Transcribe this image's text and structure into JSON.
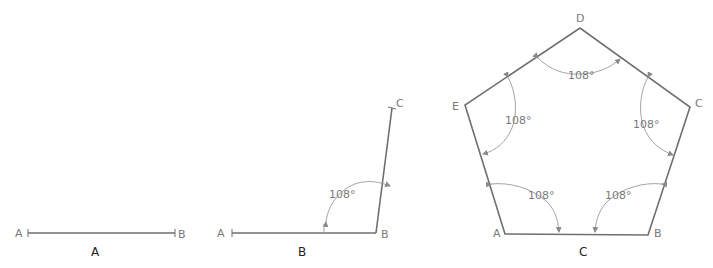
{
  "figure": {
    "panel_a": {
      "caption": "A",
      "points": {
        "A": "A",
        "B": "B"
      }
    },
    "panel_b": {
      "caption": "B",
      "points": {
        "A": "A",
        "B": "B",
        "C": "C"
      },
      "angle_label": "108°"
    },
    "panel_c": {
      "caption": "C",
      "points": {
        "A": "A",
        "B": "B",
        "C": "C",
        "D": "D",
        "E": "E"
      },
      "angle_labels": {
        "D": "108°",
        "E": "108°",
        "C": "108°",
        "A": "108°",
        "B": "108°"
      }
    }
  },
  "colors": {
    "line": "#6f6f6f",
    "arc": "#9a9a9a",
    "label": "#7a7a7a",
    "caption": "#222222"
  }
}
